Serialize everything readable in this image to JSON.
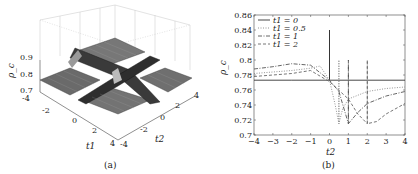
{
  "figure": {
    "panels": [
      "(a)",
      "(b)"
    ]
  },
  "chart_data": [
    {
      "panel": "(a)",
      "type": "surface3d",
      "caption": "(a)",
      "xlabel": "t1",
      "ylabel": "t2",
      "zlabel": "ρ_c",
      "x_ticks": [
        "-4",
        "-2",
        "0",
        "2",
        "4"
      ],
      "y_ticks": [
        "-4",
        "-2",
        "0",
        "2",
        "4"
      ],
      "z_ticks": [
        "0.7",
        "0.8",
        "0.9"
      ],
      "xlim": [
        -4,
        4
      ],
      "ylim": [
        -4,
        4
      ],
      "zlim": [
        0.7,
        0.9
      ],
      "description": "Mesh surface, flat at ~0.77 with cross-shaped ridges along t1=0 and t2=0 lines plus diagonal ridge t1=t2; ridges rise to ~0.84-0.9 and dip to ~0.71"
    },
    {
      "panel": "(b)",
      "type": "line",
      "caption": "(b)",
      "xlabel": "t2",
      "ylabel": "ρ_c",
      "xlim": [
        -4,
        4
      ],
      "ylim": [
        0.7,
        0.86
      ],
      "x_ticks": [
        "-4",
        "-3",
        "-2",
        "-1",
        "0",
        "1",
        "2",
        "3",
        "4"
      ],
      "y_ticks": [
        "0.7",
        "0.72",
        "0.74",
        "0.76",
        "0.78",
        "0.8",
        "0.82",
        "0.84",
        "0.86"
      ],
      "grid": false,
      "legend_position": "upper left",
      "series": [
        {
          "name": "t1 = 0",
          "style": "solid",
          "color": "#333333",
          "x": [
            -4,
            -2,
            0,
            0,
            0,
            2,
            4
          ],
          "y": [
            0.773,
            0.773,
            0.773,
            0.84,
            0.773,
            0.773,
            0.773
          ]
        },
        {
          "name": "t1 = 0.5",
          "style": "dotted",
          "color": "#888888",
          "x": [
            -4,
            -3,
            -2,
            -1,
            -0.5,
            0,
            0.3,
            0.5,
            0.5,
            0.5,
            0.7,
            1,
            2,
            3,
            4
          ],
          "y": [
            0.782,
            0.784,
            0.786,
            0.789,
            0.792,
            0.773,
            0.74,
            0.715,
            0.8,
            0.715,
            0.735,
            0.748,
            0.758,
            0.762,
            0.764
          ]
        },
        {
          "name": "t1 = 1",
          "style": "dashdot",
          "color": "#555555",
          "x": [
            -4,
            -3,
            -2,
            -1,
            0,
            0.5,
            1,
            1,
            1,
            1.5,
            2,
            3,
            4
          ],
          "y": [
            0.788,
            0.791,
            0.795,
            0.793,
            0.773,
            0.758,
            0.715,
            0.8,
            0.715,
            0.73,
            0.742,
            0.752,
            0.758
          ]
        },
        {
          "name": "t1 = 2",
          "style": "dashed",
          "color": "#666666",
          "x": [
            -4,
            -3,
            -2,
            -1,
            0,
            1,
            1.5,
            2,
            2,
            2,
            2.5,
            3,
            4
          ],
          "y": [
            0.778,
            0.78,
            0.782,
            0.786,
            0.771,
            0.748,
            0.728,
            0.715,
            0.8,
            0.715,
            0.718,
            0.728,
            0.742
          ]
        }
      ]
    }
  ]
}
